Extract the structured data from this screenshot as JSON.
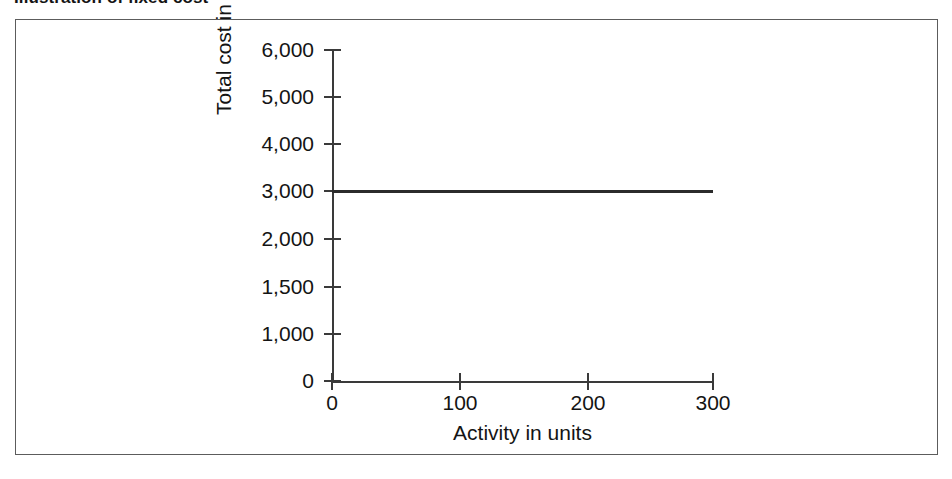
{
  "figure": {
    "title": "Illustration of fixed cost",
    "frame_color": "#5c5c5c",
    "background": "#ffffff"
  },
  "chart_data": {
    "type": "line",
    "title": "Illustration of fixed cost",
    "subtitle": "",
    "xlabel": "Activity in units",
    "ylabel": "Total cost in £s",
    "grid": false,
    "legend": "none",
    "line_color": "#2b2b2b",
    "axis_color": "#3a3a3a",
    "xlim": [
      0,
      300
    ],
    "ylim": [
      0,
      6000
    ],
    "xticks": [
      {
        "value": 0,
        "label": "0",
        "px": 331
      },
      {
        "value": 100,
        "label": "100",
        "px": 459
      },
      {
        "value": 200,
        "label": "200",
        "px": 587
      },
      {
        "value": 300,
        "label": "300",
        "px": 712
      }
    ],
    "yticks": [
      {
        "value": 6000,
        "label": "6,000",
        "px": 49
      },
      {
        "value": 5000,
        "label": "5,000",
        "px": 96
      },
      {
        "value": 4000,
        "label": "4,000",
        "px": 143
      },
      {
        "value": 3000,
        "label": "3,000",
        "px": 190
      },
      {
        "value": 2000,
        "label": "2,000",
        "px": 238
      },
      {
        "value": 1500,
        "label": "1,500",
        "px": 286
      },
      {
        "value": 1000,
        "label": "1,000",
        "px": 333
      },
      {
        "value": 0,
        "label": "0",
        "px": 380
      }
    ],
    "y_axis_note": "Tick labels are evenly spaced on the axis but non-uniform in value (6,000 / 5,000 / 4,000 / 3,000 / 2,000 / 1,500 / 1,000 / 0).",
    "series": [
      {
        "name": "Fixed cost",
        "x": [
          0,
          100,
          200,
          300
        ],
        "values": [
          3000,
          3000,
          3000,
          3000
        ]
      }
    ],
    "annotations": []
  }
}
